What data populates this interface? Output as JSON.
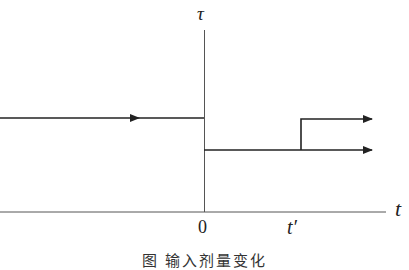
{
  "diagram": {
    "y_axis_label": "τ",
    "x_axis_label": "t",
    "x_ticks": [
      "0",
      "t′"
    ],
    "caption": "图 输入剂量变化",
    "line_color": "#222222",
    "axis_color": "#555555",
    "segments": [
      {
        "name": "before-zero",
        "level": "high",
        "from": "-∞",
        "to": "0",
        "arrow": true
      },
      {
        "name": "after-zero",
        "level": "low",
        "from": "0",
        "to": "∞",
        "arrow": true
      },
      {
        "name": "after-t-prime",
        "level": "high",
        "from": "t′",
        "to": "∞",
        "arrow": true
      }
    ]
  }
}
